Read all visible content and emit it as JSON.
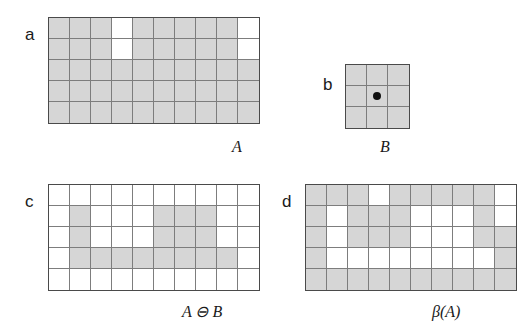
{
  "figure": {
    "grid_colors": {
      "filled": "#d6d6d6",
      "empty": "#ffffff",
      "cell_line": "#7d7d7d",
      "border": "#4a4a4a",
      "dot": "#111111",
      "text": "#1a1a1a"
    }
  },
  "panels": [
    {
      "letter": "a",
      "caption": "A",
      "rows": 5,
      "cols": 10,
      "cell": 21,
      "origin_dot": null,
      "matrix": [
        [
          1,
          1,
          1,
          0,
          1,
          1,
          1,
          1,
          1,
          0
        ],
        [
          1,
          1,
          1,
          0,
          1,
          1,
          1,
          1,
          1,
          0
        ],
        [
          1,
          1,
          1,
          1,
          1,
          1,
          1,
          1,
          1,
          1
        ],
        [
          1,
          1,
          1,
          1,
          1,
          1,
          1,
          1,
          1,
          1
        ],
        [
          1,
          1,
          1,
          1,
          1,
          1,
          1,
          1,
          1,
          1
        ]
      ]
    },
    {
      "letter": "b",
      "caption": "B",
      "rows": 3,
      "cols": 3,
      "cell": 21,
      "origin_dot": {
        "row": 1,
        "col": 1
      },
      "matrix": [
        [
          1,
          1,
          1
        ],
        [
          1,
          1,
          1
        ],
        [
          1,
          1,
          1
        ]
      ]
    },
    {
      "letter": "c",
      "caption": "A ⊖ B",
      "rows": 5,
      "cols": 10,
      "cell": 21,
      "origin_dot": null,
      "matrix": [
        [
          0,
          0,
          0,
          0,
          0,
          0,
          0,
          0,
          0,
          0
        ],
        [
          0,
          1,
          0,
          0,
          0,
          1,
          1,
          1,
          0,
          0
        ],
        [
          0,
          1,
          0,
          0,
          0,
          1,
          1,
          1,
          0,
          0
        ],
        [
          0,
          1,
          1,
          1,
          1,
          1,
          1,
          1,
          1,
          0
        ],
        [
          0,
          0,
          0,
          0,
          0,
          0,
          0,
          0,
          0,
          0
        ]
      ]
    },
    {
      "letter": "d",
      "caption": "β(A)",
      "rows": 5,
      "cols": 10,
      "cell": 21,
      "origin_dot": null,
      "matrix": [
        [
          1,
          1,
          1,
          0,
          1,
          1,
          1,
          1,
          1,
          0
        ],
        [
          1,
          0,
          1,
          1,
          1,
          0,
          0,
          0,
          1,
          0
        ],
        [
          1,
          0,
          1,
          1,
          1,
          0,
          0,
          0,
          1,
          1
        ],
        [
          1,
          0,
          0,
          0,
          0,
          0,
          0,
          0,
          0,
          1
        ],
        [
          1,
          1,
          1,
          1,
          1,
          1,
          1,
          1,
          1,
          1
        ]
      ]
    }
  ]
}
